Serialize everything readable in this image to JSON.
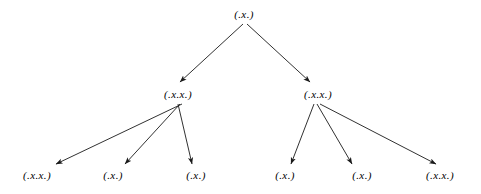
{
  "diagram": {
    "type": "derivation-tree",
    "background_color": "#ffffff",
    "stroke_color": "#1a1a1a",
    "text_color": "#000000",
    "nodes": [
      {
        "id": "root",
        "label": "(.x.)",
        "x": 244,
        "y": 14,
        "layer": 0
      },
      {
        "id": "midL",
        "label": "(.x.x.)",
        "x": 178,
        "y": 94,
        "layer": 1
      },
      {
        "id": "midR",
        "label": "(.x.x.)",
        "x": 318,
        "y": 94,
        "layer": 1
      },
      {
        "id": "leaf1",
        "label": "(.x.x.)",
        "x": 37,
        "y": 175,
        "layer": 2
      },
      {
        "id": "leaf2",
        "label": "(.x.)",
        "x": 113,
        "y": 175,
        "layer": 2
      },
      {
        "id": "leaf3",
        "label": "(.x.)",
        "x": 196,
        "y": 175,
        "layer": 2
      },
      {
        "id": "leaf4",
        "label": "(.x.)",
        "x": 285,
        "y": 175,
        "layer": 2
      },
      {
        "id": "leaf5",
        "label": "(.x.)",
        "x": 362,
        "y": 175,
        "layer": 2
      },
      {
        "id": "leaf6",
        "label": "(.x.x.)",
        "x": 440,
        "y": 175,
        "layer": 2
      }
    ],
    "edges": [
      {
        "from": "root",
        "to": "midL",
        "x1": 243,
        "y1": 24,
        "x2": 180,
        "y2": 82
      },
      {
        "from": "root",
        "to": "midR",
        "x1": 247,
        "y1": 24,
        "x2": 310,
        "y2": 82
      },
      {
        "from": "midL",
        "to": "leaf1",
        "x1": 182,
        "y1": 104,
        "x2": 56,
        "y2": 164
      },
      {
        "from": "midL",
        "to": "leaf2",
        "x1": 180,
        "y1": 104,
        "x2": 125,
        "y2": 164
      },
      {
        "from": "midL",
        "to": "leaf3",
        "x1": 178,
        "y1": 104,
        "x2": 192,
        "y2": 164
      },
      {
        "from": "midR",
        "to": "leaf4",
        "x1": 314,
        "y1": 104,
        "x2": 291,
        "y2": 164
      },
      {
        "from": "midR",
        "to": "leaf5",
        "x1": 317,
        "y1": 104,
        "x2": 352,
        "y2": 164
      },
      {
        "from": "midR",
        "to": "leaf6",
        "x1": 320,
        "y1": 104,
        "x2": 436,
        "y2": 164
      }
    ]
  }
}
